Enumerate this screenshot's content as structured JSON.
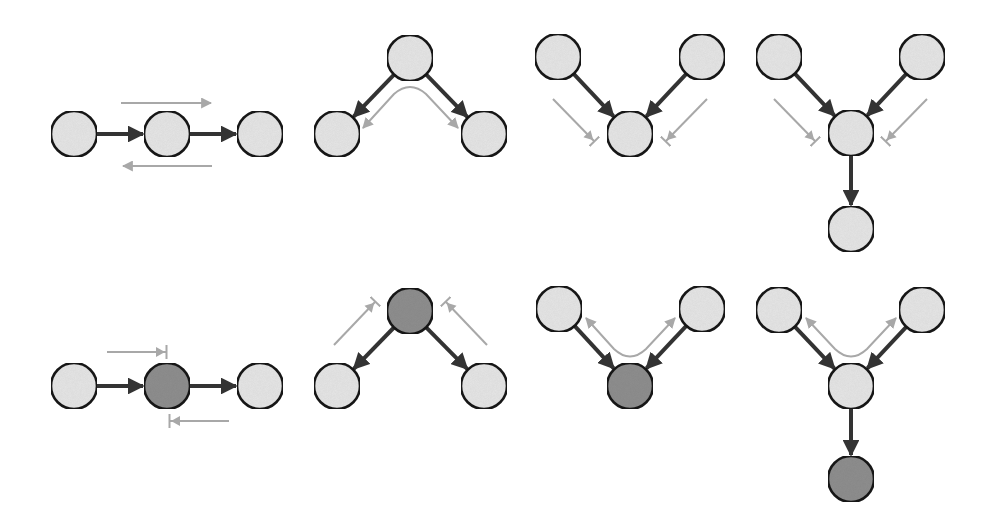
{
  "colors": {
    "background": "#ffffff",
    "node_unobserved": "#e6e6e6",
    "node_observed": "#8f8f8f",
    "node_stroke": "#1e1e1e",
    "edge": "#333333",
    "flow_arrow": "#a8a8a8"
  },
  "node_radius": 23,
  "panels": [
    {
      "id": "chain-unobserved",
      "row": 0,
      "type": "chain",
      "status": "active",
      "nodes": [
        {
          "id": "a",
          "x": 74,
          "y": 134,
          "observed": false
        },
        {
          "id": "b",
          "x": 167,
          "y": 134,
          "observed": false
        },
        {
          "id": "c",
          "x": 260,
          "y": 134,
          "observed": false
        }
      ],
      "edges": [
        [
          "a",
          "b"
        ],
        [
          "b",
          "c"
        ]
      ],
      "flows": [
        {
          "d": "M121,103 L211,103",
          "end": "arrow"
        },
        {
          "d": "M212,166 L123,166",
          "end": "arrow"
        }
      ]
    },
    {
      "id": "fork-unobserved",
      "row": 0,
      "type": "fork",
      "status": "active",
      "nodes": [
        {
          "id": "a",
          "x": 410,
          "y": 58,
          "observed": false
        },
        {
          "id": "b",
          "x": 337,
          "y": 134,
          "observed": false
        },
        {
          "id": "c",
          "x": 484,
          "y": 134,
          "observed": false
        }
      ],
      "edges": [
        [
          "a",
          "b"
        ],
        [
          "a",
          "c"
        ]
      ],
      "flows": [
        {
          "d": "M363,128 L394,94 Q410,80 426,94 L458,128",
          "end": "both-arrow"
        }
      ]
    },
    {
      "id": "collider-unobserved",
      "row": 0,
      "type": "collider",
      "status": "blocked",
      "nodes": [
        {
          "id": "a",
          "x": 558,
          "y": 57,
          "observed": false
        },
        {
          "id": "b",
          "x": 702,
          "y": 57,
          "observed": false
        },
        {
          "id": "c",
          "x": 630,
          "y": 134,
          "observed": false
        }
      ],
      "edges": [
        [
          "a",
          "c"
        ],
        [
          "b",
          "c"
        ]
      ],
      "flows": [
        {
          "d": "M553,99 L594,141",
          "end": "bar"
        },
        {
          "d": "M707,99 L666,141",
          "end": "bar"
        }
      ]
    },
    {
      "id": "collider-descendant-unobserved",
      "row": 0,
      "type": "collider-with-descendant",
      "status": "blocked",
      "nodes": [
        {
          "id": "a",
          "x": 779,
          "y": 57,
          "observed": false
        },
        {
          "id": "b",
          "x": 922,
          "y": 57,
          "observed": false
        },
        {
          "id": "c",
          "x": 851,
          "y": 133,
          "observed": false
        },
        {
          "id": "d",
          "x": 851,
          "y": 229,
          "observed": false
        }
      ],
      "edges": [
        [
          "a",
          "c"
        ],
        [
          "b",
          "c"
        ],
        [
          "c",
          "d"
        ]
      ],
      "flows": [
        {
          "d": "M774,99 L815,141",
          "end": "bar"
        },
        {
          "d": "M927,99 L886,141",
          "end": "bar"
        }
      ]
    },
    {
      "id": "chain-observed",
      "row": 1,
      "type": "chain",
      "status": "blocked",
      "nodes": [
        {
          "id": "a",
          "x": 74,
          "y": 386,
          "observed": false
        },
        {
          "id": "b",
          "x": 167,
          "y": 386,
          "observed": true
        },
        {
          "id": "c",
          "x": 260,
          "y": 386,
          "observed": false
        }
      ],
      "edges": [
        [
          "a",
          "b"
        ],
        [
          "b",
          "c"
        ]
      ],
      "flows": [
        {
          "d": "M107,352 L166,352",
          "end": "bar"
        },
        {
          "d": "M229,421 L170,421",
          "end": "bar"
        }
      ]
    },
    {
      "id": "fork-observed",
      "row": 1,
      "type": "fork",
      "status": "blocked",
      "nodes": [
        {
          "id": "a",
          "x": 410,
          "y": 311,
          "observed": true
        },
        {
          "id": "b",
          "x": 337,
          "y": 386,
          "observed": false
        },
        {
          "id": "c",
          "x": 484,
          "y": 386,
          "observed": false
        }
      ],
      "edges": [
        [
          "a",
          "b"
        ],
        [
          "a",
          "c"
        ]
      ],
      "flows": [
        {
          "d": "M334,345 L375,302",
          "end": "bar"
        },
        {
          "d": "M487,345 L446,302",
          "end": "bar"
        }
      ]
    },
    {
      "id": "collider-observed",
      "row": 1,
      "type": "collider",
      "status": "active",
      "nodes": [
        {
          "id": "a",
          "x": 559,
          "y": 309,
          "observed": false
        },
        {
          "id": "b",
          "x": 702,
          "y": 309,
          "observed": false
        },
        {
          "id": "c",
          "x": 630,
          "y": 386,
          "observed": true
        }
      ],
      "edges": [
        [
          "a",
          "c"
        ],
        [
          "b",
          "c"
        ]
      ],
      "flows": [
        {
          "d": "M586,318 L614,349 Q630,364 646,349 L675,318",
          "end": "both-arrow"
        }
      ]
    },
    {
      "id": "collider-descendant-observed",
      "row": 1,
      "type": "collider-with-descendant",
      "status": "active",
      "nodes": [
        {
          "id": "a",
          "x": 779,
          "y": 310,
          "observed": false
        },
        {
          "id": "b",
          "x": 922,
          "y": 310,
          "observed": false
        },
        {
          "id": "c",
          "x": 851,
          "y": 386,
          "observed": false
        },
        {
          "id": "d",
          "x": 851,
          "y": 479,
          "observed": true
        }
      ],
      "edges": [
        [
          "a",
          "c"
        ],
        [
          "b",
          "c"
        ],
        [
          "c",
          "d"
        ]
      ],
      "flows": [
        {
          "d": "M806,318 L835,349 Q851,364 867,349 L896,318",
          "end": "both-arrow"
        }
      ]
    }
  ]
}
